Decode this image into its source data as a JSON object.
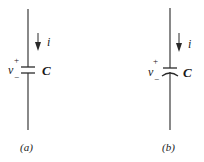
{
  "figures": [
    {
      "id": "a",
      "caption": "(a)",
      "current_label": "i",
      "voltage_label": "v",
      "voltage_plus": "+",
      "voltage_minus": "−",
      "component_label": "C",
      "capacitor_type": "non-polarized (two straight plates)"
    },
    {
      "id": "b",
      "caption": "(b)",
      "current_label": "i",
      "voltage_label": "v",
      "voltage_plus": "+",
      "voltage_minus": "−",
      "component_label": "C",
      "capacitor_type": "polarized (straight plate over curved plate)"
    }
  ],
  "colors": {
    "line": "#3a3a3a",
    "text": "#1a1a1a",
    "background": "#ffffff"
  }
}
